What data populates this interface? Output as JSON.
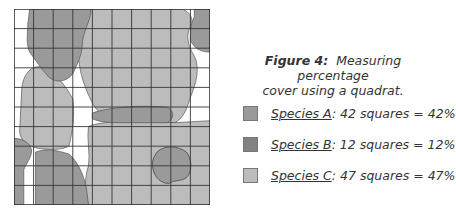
{
  "figure": {
    "label": "Figure 4:",
    "caption_line1": "Measuring percentage",
    "caption_line2": "cover using a quadrat."
  },
  "quadrat": {
    "rows": 10,
    "cols": 10,
    "total_squares": 100
  },
  "legend": [
    {
      "species": "Species A",
      "detail": ": 42 squares = 42%",
      "squares": 42,
      "percent": 42,
      "color": "#9a9a9a"
    },
    {
      "species": "Species B",
      "detail": ": 12 squares = 12%",
      "squares": 12,
      "percent": 12,
      "color": "#838383"
    },
    {
      "species": "Species C",
      "detail": ": 47 squares = 47%",
      "squares": 47,
      "percent": 47,
      "color": "#bcbcbc"
    }
  ],
  "colors": {
    "species_a": "#9a9a9a",
    "species_b": "#838383",
    "species_c": "#bcbcbc",
    "grid": "#333333",
    "outline": "#555555"
  }
}
